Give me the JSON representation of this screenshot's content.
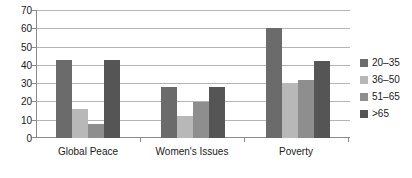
{
  "chart_data": {
    "type": "bar",
    "title": "",
    "subtitle": "",
    "xlabel": "",
    "ylabel": "",
    "ylim": [
      0,
      70
    ],
    "ytick_step": 10,
    "yticks": [
      0,
      10,
      20,
      30,
      40,
      50,
      60,
      70
    ],
    "ytick_labels": [
      "0",
      "10",
      "20",
      "30",
      "40",
      "50",
      "60",
      "70"
    ],
    "grid": true,
    "grid_axis": "y",
    "legend_position": "right",
    "categories": [
      "Global Peace",
      "Women's Issues",
      "Poverty"
    ],
    "series": [
      {
        "name": "20–35",
        "color": "#6b6b6b",
        "values": [
          42.5,
          28,
          60
        ]
      },
      {
        "name": "36–50",
        "color": "#b8b8b8",
        "values": [
          16,
          12,
          30
        ]
      },
      {
        "name": "51–65",
        "color": "#8e8e8e",
        "values": [
          7.5,
          19.5,
          32
        ]
      },
      {
        "name": ">65",
        "color": "#555555",
        "values": [
          42.5,
          28,
          42
        ]
      }
    ]
  },
  "legend": {
    "items": [
      {
        "label": "20–35",
        "color": "#6b6b6b"
      },
      {
        "label": "36–50",
        "color": "#b8b8b8"
      },
      {
        "label": "51–65",
        "color": "#8e8e8e"
      },
      {
        "label": ">65",
        "color": "#555555"
      }
    ]
  },
  "axis": {
    "y_labels": [
      "70",
      "60",
      "50",
      "40",
      "30",
      "20",
      "10",
      "0"
    ],
    "x_labels": [
      "Global Peace",
      "Women's Issues",
      "Poverty"
    ]
  }
}
